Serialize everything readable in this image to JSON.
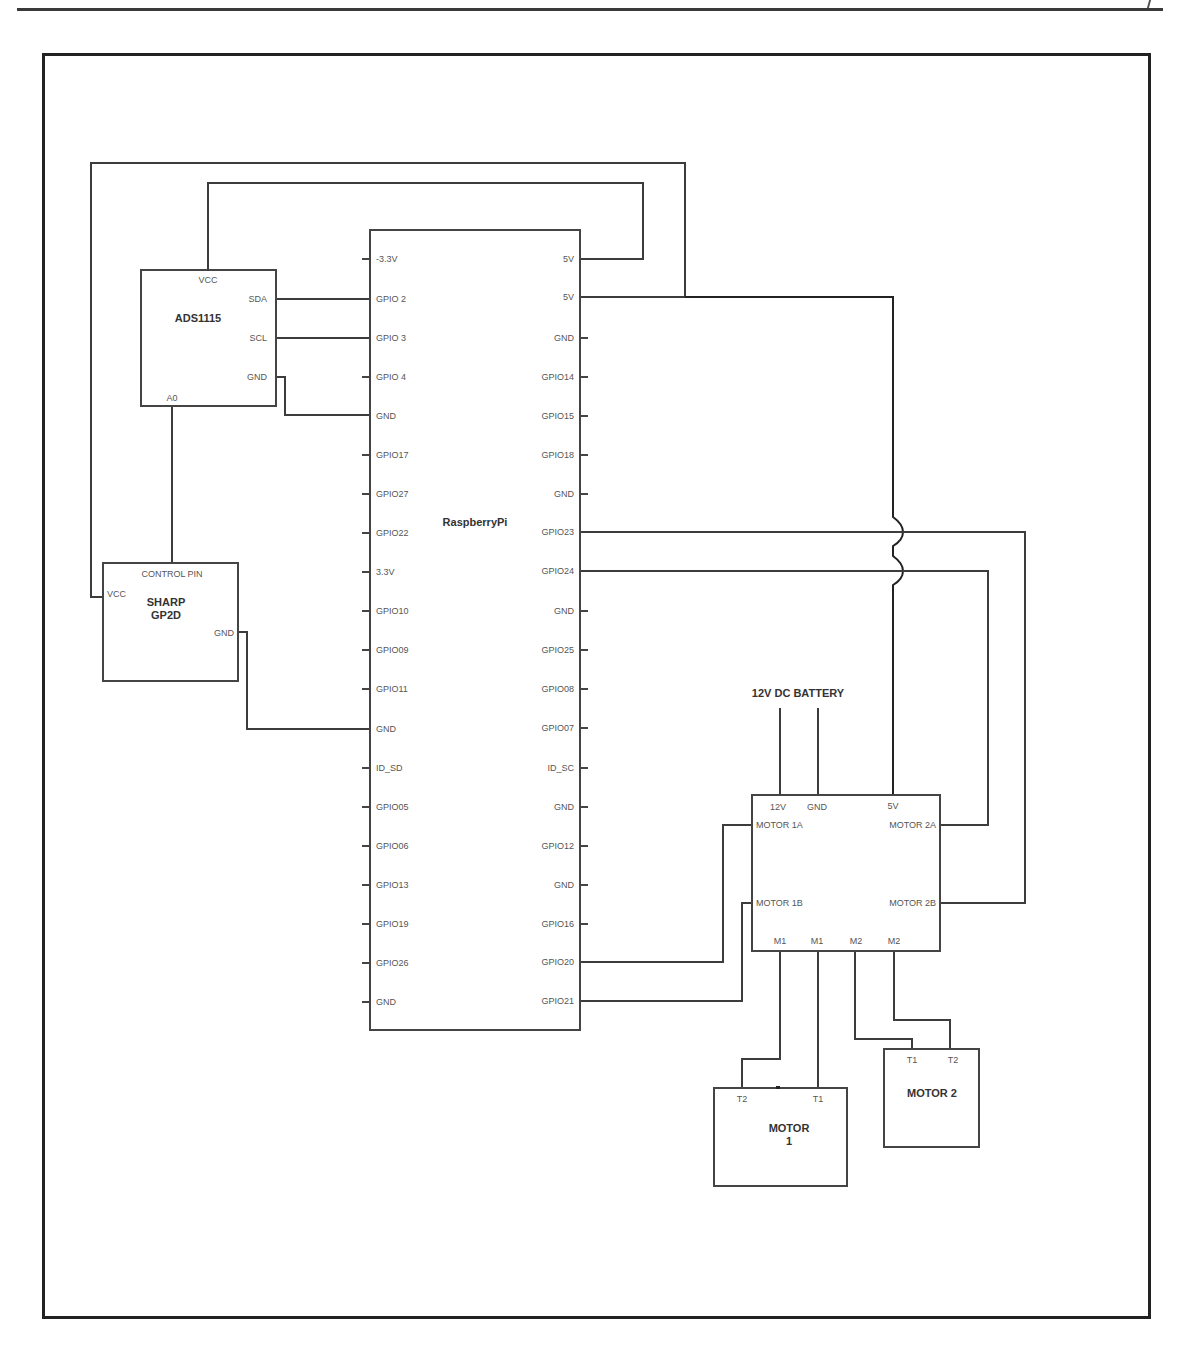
{
  "diagram": {
    "type": "circuit-schematic",
    "components": {
      "ads1115": {
        "title": "ADS1115",
        "pins": {
          "vcc": "VCC",
          "sda": "SDA",
          "scl": "SCL",
          "gnd": "GND",
          "a0": "A0"
        }
      },
      "sharp": {
        "title_line1": "SHARP",
        "title_line2": "GP2D",
        "pins": {
          "control": "CONTROL PIN",
          "vcc": "VCC",
          "gnd": "GND"
        }
      },
      "raspberry_pi": {
        "title": "RaspberryPi",
        "left_pins": [
          "-3.3V",
          "GPIO 2",
          "GPIO 3",
          "GPIO 4",
          "GND",
          "GPIO17",
          "GPIO27",
          "GPIO22",
          "3.3V",
          "GPIO10",
          "GPIO09",
          "GPIO11",
          "GND",
          "ID_SD",
          "GPIO05",
          "GPIO06",
          "GPIO13",
          "GPIO19",
          "GPIO26",
          "GND"
        ],
        "right_pins": [
          "5V",
          "5V",
          "GND",
          "GPIO14",
          "GPIO15",
          "GPIO18",
          "GND",
          "GPIO23",
          "GPIO24",
          "GND",
          "GPIO25",
          "GPIO08",
          "GPIO07",
          "ID_SC",
          "GND",
          "GPIO12",
          "GND",
          "GPIO16",
          "GPIO20",
          "GPIO21"
        ]
      },
      "battery": {
        "title": "12V DC BATTERY"
      },
      "motor_driver": {
        "pins": {
          "v12": "12V",
          "gnd": "GND",
          "v5": "5V",
          "motor1a": "MOTOR 1A",
          "motor1b": "MOTOR 1B",
          "motor2a": "MOTOR 2A",
          "motor2b": "MOTOR 2B",
          "m1a": "M1",
          "m1b": "M1",
          "m2a": "M2",
          "m2b": "M2"
        }
      },
      "motor1": {
        "title_line1": "MOTOR",
        "title_line2": "1",
        "pins": {
          "t2": "T2",
          "t1": "T1"
        }
      },
      "motor2": {
        "title": "MOTOR 2",
        "pins": {
          "t1": "T1",
          "t2": "T2"
        }
      }
    },
    "connections": [
      {
        "from": "ADS1115.VCC",
        "to": "RaspberryPi.5V(1)"
      },
      {
        "from": "SHARP.VCC",
        "to": "RaspberryPi.5V(2)"
      },
      {
        "from": "ADS1115.SDA",
        "to": "RaspberryPi.GPIO 2"
      },
      {
        "from": "ADS1115.SCL",
        "to": "RaspberryPi.GPIO 3"
      },
      {
        "from": "ADS1115.GND",
        "to": "RaspberryPi.GND"
      },
      {
        "from": "ADS1115.A0",
        "to": "SHARP.CONTROL PIN"
      },
      {
        "from": "SHARP.GND",
        "to": "RaspberryPi.GND"
      },
      {
        "from": "RaspberryPi.5V(2)",
        "to": "MotorDriver.5V"
      },
      {
        "from": "RaspberryPi.GPIO23",
        "to": "MotorDriver.MOTOR 2B"
      },
      {
        "from": "RaspberryPi.GPIO24",
        "to": "MotorDriver.MOTOR 2A"
      },
      {
        "from": "RaspberryPi.GPIO20",
        "to": "MotorDriver.MOTOR 1A"
      },
      {
        "from": "RaspberryPi.GPIO21",
        "to": "MotorDriver.MOTOR 1B"
      },
      {
        "from": "Battery.+",
        "to": "MotorDriver.12V"
      },
      {
        "from": "Battery.-",
        "to": "MotorDriver.GND"
      },
      {
        "from": "MotorDriver.M1",
        "to": "MOTOR1.T2"
      },
      {
        "from": "MotorDriver.M1",
        "to": "MOTOR1.T1"
      },
      {
        "from": "MotorDriver.M2",
        "to": "MOTOR2.T1"
      },
      {
        "from": "MotorDriver.M2",
        "to": "MOTOR2.T2"
      }
    ],
    "colors": {
      "line": "#3c3c3c",
      "frame": "#222222",
      "text": "#555555",
      "background": "#ffffff"
    }
  }
}
